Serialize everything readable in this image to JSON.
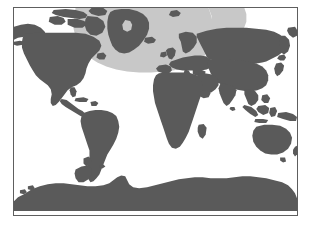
{
  "figure": {
    "type": "map",
    "projection": "equirectangular",
    "background_color": "#ffffff",
    "frame": {
      "border_color": "#5e5e5e",
      "border_width_px": 1,
      "x": 13,
      "y": 7,
      "width": 285,
      "height": 209
    },
    "colors": {
      "land": "#5a5a5a",
      "ocean": "#ffffff",
      "highlight": "#c8c8c8",
      "border": "#5e5e5e"
    },
    "legend": {
      "visible": false,
      "entries": [
        {
          "label": "Land",
          "color": "#5a5a5a"
        },
        {
          "label": "Highlighted range",
          "color": "#c8c8c8"
        },
        {
          "label": "Ocean",
          "color": "#ffffff"
        }
      ]
    },
    "labels": [],
    "axis_ticks": [],
    "highlight_region": {
      "name": "north-atlantic-range",
      "color": "#c8c8c8",
      "description": "North Atlantic, Greenland, northern North America and Europe",
      "covers": [
        "Greenland",
        "Northern Canada",
        "North Atlantic Ocean",
        "British Isles",
        "Scandinavia",
        "Western Europe",
        "Iberian Peninsula",
        "Eastern Europe"
      ]
    },
    "landmasses": [
      "North America",
      "South America",
      "Greenland",
      "Europe",
      "Africa",
      "Asia",
      "Australia",
      "Antarctica",
      "Indonesia",
      "Japan",
      "Madagascar",
      "New Zealand",
      "British Isles",
      "Iceland"
    ]
  }
}
